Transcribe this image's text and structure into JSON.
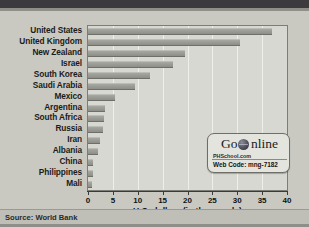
{
  "chart_data": {
    "type": "bar",
    "orientation": "horizontal",
    "title": "",
    "xlabel": "U.S. dollars (in thousands)",
    "ylabel": "",
    "xlim": [
      0,
      40
    ],
    "xticks": [
      0,
      5,
      10,
      15,
      20,
      25,
      30,
      35,
      40
    ],
    "grid": true,
    "legend": false,
    "categories": [
      "United States",
      "United Kingdom",
      "New Zealand",
      "Israel",
      "South Korea",
      "Saudi Arabia",
      "Mexico",
      "Argentina",
      "South Africa",
      "Russia",
      "Iran",
      "Albania",
      "China",
      "Philippines",
      "Mali"
    ],
    "values": [
      37,
      30.5,
      19.5,
      17,
      12.5,
      9.5,
      5.5,
      3.5,
      3.3,
      3,
      2.5,
      2,
      1.1,
      1,
      0.8
    ],
    "source": "Source: World Bank"
  },
  "badge": {
    "title_left": "Go",
    "title_right": "nline",
    "site": "PHSchool.com",
    "code": "Web Code: mng-7182"
  }
}
